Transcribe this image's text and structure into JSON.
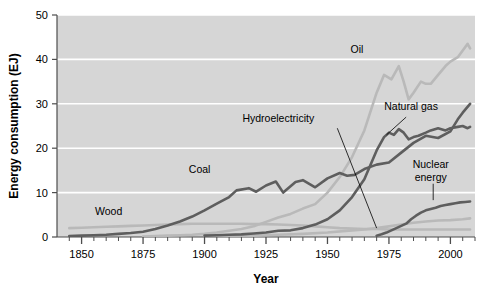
{
  "chart_data": {
    "type": "line",
    "title": "",
    "xlabel": "Year",
    "ylabel": "Energy consumption (EJ)",
    "xlim": [
      1840,
      2010
    ],
    "ylim": [
      0,
      50
    ],
    "yticks": [
      0,
      10,
      20,
      30,
      40,
      50
    ],
    "xticks": [
      1850,
      1875,
      1900,
      1925,
      1950,
      1975,
      2000
    ],
    "xminor_step": 5,
    "grid": "horizontal-white",
    "legend": "inline-annotations",
    "plot_background": "#d6d6d6",
    "colors": {
      "dark": "#5e5e5e",
      "light": "#b9b9b9",
      "grid": "#ffffff",
      "axis": "#4d4d4d"
    },
    "series": [
      {
        "name": "Wood",
        "color": "#b9b9b9",
        "label": "Wood",
        "label_x": 1861,
        "label_y": 5.0,
        "leader": null,
        "x": [
          1845,
          1850,
          1855,
          1860,
          1865,
          1870,
          1875,
          1880,
          1885,
          1890,
          1895,
          1900,
          1905,
          1910,
          1915,
          1920,
          1925,
          1930,
          1935,
          1940,
          1945,
          1950,
          1955,
          1960,
          1965,
          1970,
          1975,
          1980,
          1985,
          1990,
          1995,
          2000,
          2005,
          2008
        ],
        "y": [
          2.0,
          2.1,
          2.2,
          2.3,
          2.4,
          2.5,
          2.6,
          2.7,
          2.8,
          2.9,
          3.0,
          3.0,
          3.0,
          3.0,
          3.0,
          2.9,
          2.9,
          2.8,
          2.7,
          2.6,
          2.4,
          2.2,
          2.0,
          1.9,
          1.8,
          1.8,
          1.7,
          1.7,
          1.7,
          1.7,
          1.7,
          1.7,
          1.7,
          1.7
        ]
      },
      {
        "name": "Coal",
        "color": "#5e5e5e",
        "label": "Coal",
        "label_x": 1898,
        "label_y": 14.5,
        "leader": null,
        "x": [
          1845,
          1850,
          1855,
          1860,
          1865,
          1870,
          1875,
          1880,
          1885,
          1890,
          1895,
          1900,
          1905,
          1910,
          1913,
          1918,
          1921,
          1925,
          1929,
          1932,
          1937,
          1940,
          1945,
          1950,
          1955,
          1958,
          1961,
          1965,
          1970,
          1975,
          1980,
          1985,
          1990,
          1995,
          2000,
          2003,
          2005,
          2008
        ],
        "y": [
          0.2,
          0.3,
          0.4,
          0.5,
          0.7,
          0.9,
          1.2,
          1.8,
          2.6,
          3.5,
          4.6,
          6.0,
          7.5,
          9.0,
          10.5,
          11.0,
          10.2,
          11.6,
          12.5,
          10.0,
          12.4,
          12.8,
          11.2,
          13.2,
          14.4,
          13.8,
          14.0,
          15.3,
          16.3,
          16.8,
          19.0,
          21.2,
          22.8,
          22.3,
          23.8,
          26.5,
          28.0,
          30.0
        ]
      },
      {
        "name": "Oil",
        "color": "#b9b9b9",
        "label": "Oil",
        "label_x": 1962,
        "label_y": 41.5,
        "leader": null,
        "x": [
          1875,
          1880,
          1885,
          1890,
          1895,
          1900,
          1905,
          1910,
          1915,
          1920,
          1925,
          1930,
          1935,
          1940,
          1945,
          1950,
          1955,
          1960,
          1965,
          1970,
          1973,
          1976,
          1979,
          1981,
          1983,
          1985,
          1988,
          1990,
          1992,
          1995,
          1998,
          2000,
          2003,
          2005,
          2007,
          2008
        ],
        "y": [
          0.1,
          0.2,
          0.3,
          0.4,
          0.5,
          0.7,
          1.0,
          1.4,
          1.8,
          2.4,
          3.4,
          4.4,
          5.2,
          6.4,
          7.4,
          10.0,
          13.5,
          18.0,
          24.0,
          32.5,
          36.5,
          35.5,
          38.5,
          35.0,
          31.0,
          32.5,
          35.0,
          34.5,
          34.5,
          36.5,
          38.5,
          39.5,
          40.5,
          42.0,
          43.5,
          42.5
        ]
      },
      {
        "name": "Natural gas",
        "color": "#5e5e5e",
        "label": "Natural gas",
        "label_x": 1984,
        "label_y": 28.5,
        "leader": {
          "x1": 1982,
          "y1": 27.0,
          "x2": 1974,
          "y2": 23.0
        },
        "x": [
          1900,
          1905,
          1910,
          1915,
          1920,
          1925,
          1930,
          1935,
          1940,
          1945,
          1950,
          1955,
          1960,
          1965,
          1970,
          1973,
          1975,
          1977,
          1979,
          1981,
          1983,
          1985,
          1987,
          1990,
          1992,
          1995,
          1998,
          2000,
          2003,
          2005,
          2007,
          2008
        ],
        "y": [
          0.3,
          0.4,
          0.5,
          0.6,
          0.8,
          1.0,
          1.4,
          1.5,
          2.0,
          2.8,
          4.0,
          6.0,
          9.0,
          13.0,
          19.5,
          22.5,
          23.5,
          23.0,
          24.3,
          23.5,
          22.0,
          22.5,
          22.8,
          23.5,
          24.0,
          24.5,
          24.0,
          24.5,
          24.8,
          25.0,
          24.5,
          24.8
        ]
      },
      {
        "name": "Hydroelectricity",
        "color": "#b9b9b9",
        "label": "Hydroelectricity",
        "label_x": 1930,
        "label_y": 26.0,
        "leader": {
          "x1": 1954,
          "y1": 24.5,
          "x2": 1970,
          "y2": 2.0
        },
        "x": [
          1900,
          1910,
          1920,
          1930,
          1940,
          1950,
          1960,
          1965,
          1970,
          1975,
          1980,
          1985,
          1990,
          1995,
          2000,
          2005,
          2008
        ],
        "y": [
          0.1,
          0.2,
          0.3,
          0.5,
          0.7,
          1.0,
          1.5,
          1.7,
          2.0,
          2.4,
          2.8,
          3.2,
          3.5,
          3.7,
          3.8,
          4.0,
          4.2
        ]
      },
      {
        "name": "Nuclear energy",
        "color": "#5e5e5e",
        "label_line1": "Nuclear",
        "label_line2": "energy",
        "label_x": 1992,
        "label_y": 15.5,
        "leader": {
          "x1": 1993,
          "y1": 12.0,
          "x2": 1993,
          "y2": 8.3
        },
        "x": [
          1970,
          1972,
          1974,
          1976,
          1978,
          1980,
          1982,
          1984,
          1986,
          1988,
          1990,
          1992,
          1994,
          1996,
          1998,
          2000,
          2002,
          2004,
          2006,
          2008
        ],
        "y": [
          0.3,
          0.6,
          1.0,
          1.5,
          2.0,
          2.5,
          3.0,
          4.0,
          4.8,
          5.5,
          6.0,
          6.3,
          6.6,
          7.0,
          7.2,
          7.4,
          7.6,
          7.8,
          7.9,
          8.0
        ]
      }
    ]
  },
  "axes": {
    "ylabel": "Energy consumption (EJ)",
    "xlabel": "Year",
    "ytick_labels": [
      "0",
      "10",
      "20",
      "30",
      "40",
      "50"
    ],
    "xtick_labels": [
      "1850",
      "1875",
      "1900",
      "1925",
      "1950",
      "1975",
      "2000"
    ]
  }
}
